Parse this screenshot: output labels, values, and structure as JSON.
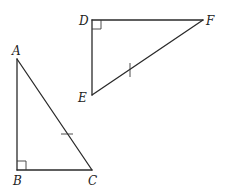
{
  "figure": {
    "triangles": [
      {
        "name": "ABC",
        "vertices": {
          "A": "A",
          "B": "B",
          "C": "C"
        },
        "right_angle_at": "B",
        "tick_marked_side": "AC"
      },
      {
        "name": "DEF",
        "vertices": {
          "D": "D",
          "E": "E",
          "F": "F"
        },
        "right_angle_at": "D",
        "tick_marked_side": "EF"
      }
    ],
    "labels": {
      "A": "A",
      "B": "B",
      "C": "C",
      "D": "D",
      "E": "E",
      "F": "F"
    },
    "colors": {
      "line": "#2a2a2a",
      "background": "#ffffff"
    }
  }
}
